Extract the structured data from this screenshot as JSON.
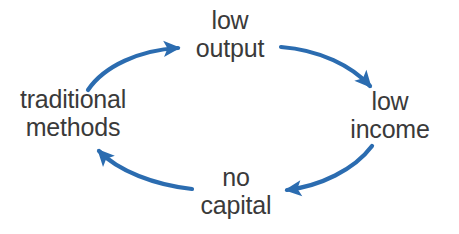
{
  "diagram": {
    "type": "cycle",
    "direction": "clockwise",
    "background_color": "#ffffff",
    "arrow_color": "#2b6cb0",
    "text_color": "#3a3a3a",
    "nodes": [
      {
        "id": "low-output",
        "position": "top",
        "line1": "low",
        "line2": "output"
      },
      {
        "id": "low-income",
        "position": "right",
        "line1": "low",
        "line2": "income"
      },
      {
        "id": "no-capital",
        "position": "bottom",
        "line1": "no",
        "line2": "capital"
      },
      {
        "id": "traditional",
        "position": "left",
        "line1": "traditional",
        "line2": "methods"
      }
    ],
    "edges": [
      {
        "id": "edge-traditional-to-low-output",
        "from": "traditional methods",
        "to": "low output",
        "arrowhead": "right"
      },
      {
        "id": "edge-low-output-to-low-income",
        "from": "low output",
        "to": "low income",
        "arrowhead": "down-right"
      },
      {
        "id": "edge-low-income-to-no-capital",
        "from": "low income",
        "to": "no capital",
        "arrowhead": "left"
      },
      {
        "id": "edge-no-capital-to-traditional",
        "from": "no capital",
        "to": "traditional methods",
        "arrowhead": "up-left"
      }
    ]
  }
}
